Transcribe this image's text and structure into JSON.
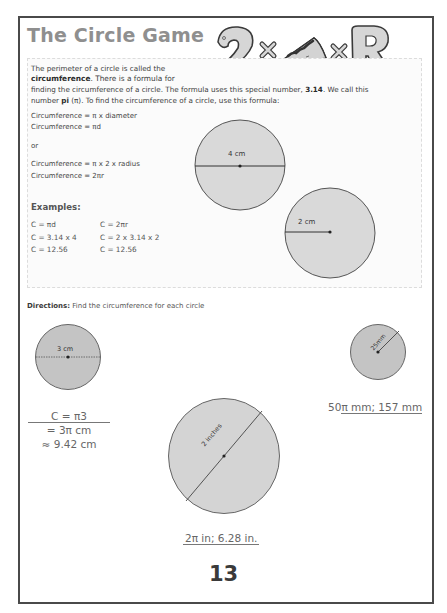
{
  "page": {
    "title": "The Circle Game",
    "header_art": {
      "glyph_left": "2",
      "times_1": "×",
      "pie_icon": "pie-slice",
      "times_2": "×",
      "glyph_right": "R"
    },
    "page_number": "13"
  },
  "intro": {
    "line1": "The perimeter of a circle is called the",
    "line2_bold": "circumference",
    "line2_rest": ". There is a formula for",
    "line3_start": "finding the circumference of a circle. The formula uses this special number, ",
    "line3_bold": "3.14",
    "line3_end": ". We call this",
    "line4_start": "number ",
    "line4_bold": "pi",
    "line4_end": " (π). To find the circumference of a circle, use this formula:"
  },
  "formulas": {
    "f1": "Circumference =  π x diameter",
    "f2": "Circumference =  πd",
    "or": "or",
    "f3": "Circumference =  π x 2 x radius",
    "f4": "Circumference =  2πr"
  },
  "examples": {
    "heading": "Examples:",
    "col1": [
      "C =  πd",
      "C = 3.14 x 4",
      "C = 12.56"
    ],
    "col2": [
      "C = 2πr",
      "C = 2 x 3.14 x 2",
      "C = 12.56"
    ]
  },
  "example_circles": [
    {
      "label": "4 cm",
      "measure": "diameter"
    },
    {
      "label": "2 cm",
      "measure": "radius"
    }
  ],
  "exercise": {
    "directions_label": "Directions:",
    "directions_text": " Find the circumference for each circle",
    "circles": [
      {
        "label": "3 cm",
        "measure": "diameter"
      },
      {
        "label": "2 inches",
        "measure": "diameter"
      },
      {
        "label": "25mm",
        "measure": "radius"
      }
    ],
    "answers": {
      "a1_line1": "C =  π3",
      "a1_line2": "= 3π cm",
      "a1_line3": "≈ 9.42 cm",
      "a2": "2π in; 6.28 in.",
      "a3_prefix": "50",
      "a3_underlined": "π mm; 157 mm"
    }
  },
  "colors": {
    "frame": "#4a4a4a",
    "title": "#8f8f8f",
    "circle_fill": "#d9d9d9",
    "exercise_fill": "#c4c4c4"
  }
}
